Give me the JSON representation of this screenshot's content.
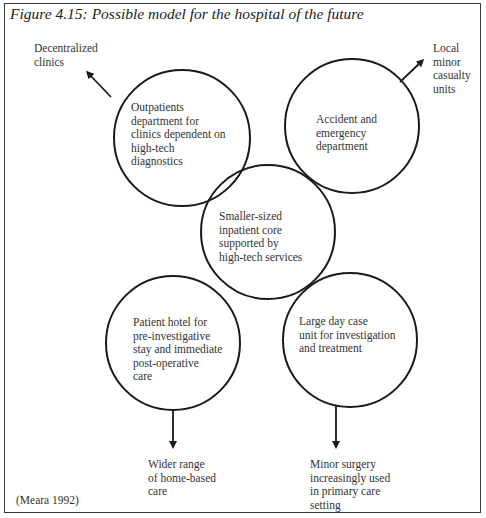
{
  "figure": {
    "title": "Figure 4.15: Possible model for the hospital of the future",
    "source": "(Meara 1992)"
  },
  "nodes": {
    "outpatients": [
      "Outpatients",
      "department for",
      "clinics dependent on",
      "high-tech",
      "diagnostics"
    ],
    "accident": [
      "Accident and",
      "emergency",
      "department"
    ],
    "core": [
      "Smaller-sized",
      "inpatient core",
      "supported by",
      "high-tech services"
    ],
    "hotel": [
      "Patient hotel for",
      "pre-investigative",
      "stay and immediate",
      "post-operative",
      "care"
    ],
    "daycase": [
      "Large day case",
      "unit for investigation",
      "and treatment"
    ]
  },
  "outcomes": {
    "decentralized": [
      "Decentralized",
      "clinics"
    ],
    "casualty": [
      "Local",
      "minor",
      "casualty",
      "units"
    ],
    "homecare": [
      "Wider range",
      "of home-based",
      "care"
    ],
    "minorsurgery": [
      "Minor surgery",
      "increasingly used",
      "in primary care",
      "setting"
    ]
  },
  "colors": {
    "stroke": "#1a1a1a",
    "text": "#333333"
  }
}
